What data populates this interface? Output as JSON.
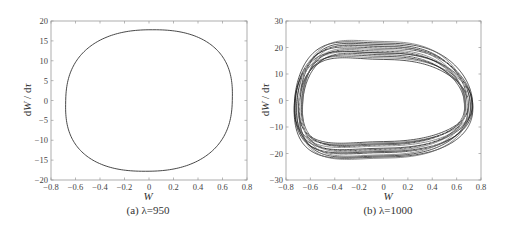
{
  "chart_data": [
    {
      "type": "line",
      "title": "",
      "caption": "(a) λ=950",
      "xlabel": "W",
      "ylabel": "dW / dτ",
      "xlim": [
        -0.8,
        0.8
      ],
      "ylim": [
        -20,
        20
      ],
      "xticks": [
        -0.8,
        -0.6,
        -0.4,
        -0.2,
        0,
        0.2,
        0.4,
        0.6,
        0.8
      ],
      "xtick_labels": [
        "−0.8",
        "−0.6",
        "−0.4",
        "−0.2",
        "0",
        "0.2",
        "0.4",
        "0.6",
        "0.8"
      ],
      "yticks": [
        -20,
        -15,
        -10,
        -5,
        0,
        5,
        10,
        15,
        20
      ],
      "ytick_labels": [
        "−20",
        "−15",
        "−10",
        "−5",
        "0",
        "5",
        "10",
        "15",
        "20"
      ],
      "grid": false,
      "series": [
        {
          "name": "limit cycle",
          "kind": "closed-orbit",
          "amplitude_w": 0.68,
          "amplitude_dw": 17.8,
          "x": [
            0.68,
            0.66,
            0.6,
            0.5,
            0.4,
            0.3,
            0.2,
            0.1,
            0.0,
            -0.1,
            -0.2,
            -0.3,
            -0.4,
            -0.5,
            -0.6,
            -0.66,
            -0.67,
            -0.66,
            -0.6,
            -0.5,
            -0.4,
            -0.3,
            -0.2,
            -0.1,
            0.0,
            0.1,
            0.2,
            0.3,
            0.4,
            0.5,
            0.6,
            0.66,
            0.68
          ],
          "y": [
            0,
            5,
            10,
            13.5,
            15.5,
            16.8,
            17.5,
            17.8,
            17.8,
            17.6,
            17.0,
            16.2,
            15.0,
            12.5,
            8.5,
            4,
            0,
            -4,
            -8.5,
            -12.5,
            -15,
            -16.3,
            -17.1,
            -17.6,
            -17.8,
            -17.7,
            -17.4,
            -16.7,
            -15.3,
            -13.0,
            -9.5,
            -5,
            0
          ]
        }
      ]
    },
    {
      "type": "line",
      "title": "",
      "caption": "(b) λ=1000",
      "xlabel": "W",
      "ylabel": "dW / dτ",
      "xlim": [
        -0.8,
        0.8
      ],
      "ylim": [
        -30,
        30
      ],
      "xticks": [
        -0.8,
        -0.6,
        -0.4,
        -0.2,
        0,
        0.2,
        0.4,
        0.6,
        0.8
      ],
      "xtick_labels": [
        "−0.8",
        "−0.6",
        "−0.4",
        "−0.2",
        "0",
        "0.2",
        "0.4",
        "0.6",
        "0.8"
      ],
      "yticks": [
        -30,
        -20,
        -10,
        0,
        10,
        20,
        30
      ],
      "ytick_labels": [
        "−30",
        "−20",
        "−10",
        "0",
        "10",
        "20",
        "30"
      ],
      "grid": false,
      "series": [
        {
          "name": "quasi-periodic orbit band",
          "kind": "orbit-band",
          "w_amplitude_range": [
            0.66,
            0.73
          ],
          "dw_amplitude_range": [
            15.5,
            22
          ],
          "turns": 14
        }
      ]
    }
  ]
}
